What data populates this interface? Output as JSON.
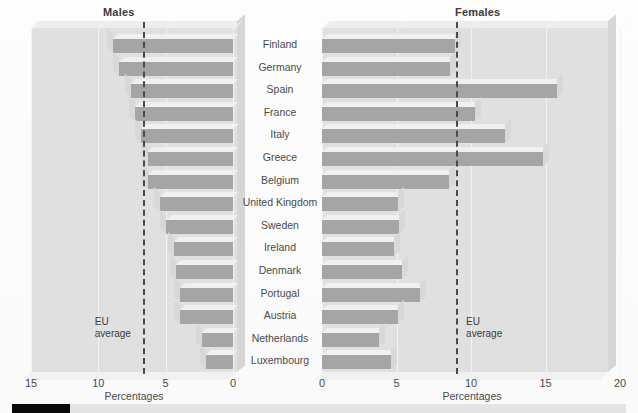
{
  "panels": {
    "left": {
      "title": "Males",
      "eu_label_line1": "EU",
      "eu_label_line2": "average",
      "axis_title": "Percentages"
    },
    "right": {
      "title": "Females",
      "eu_label_line1": "EU",
      "eu_label_line2": "average",
      "axis_title": "Percentages"
    }
  },
  "axes": {
    "left_ticks": [
      "15",
      "10",
      "5",
      "0"
    ],
    "right_ticks": [
      "0",
      "5",
      "10",
      "15",
      "20"
    ]
  },
  "countries": [
    "Finland",
    "Germany",
    "Spain",
    "France",
    "Italy",
    "Greece",
    "Belgium",
    "United Kingdom",
    "Sweden",
    "Ireland",
    "Denmark",
    "Portugal",
    "Austria",
    "Netherlands",
    "Luxembourg"
  ],
  "chart_data": {
    "type": "bar",
    "orientation": "horizontal",
    "layout": "back-to-back pyramid, two panels",
    "categories": [
      "Finland",
      "Germany",
      "Spain",
      "France",
      "Italy",
      "Greece",
      "Belgium",
      "United Kingdom",
      "Sweden",
      "Ireland",
      "Denmark",
      "Portugal",
      "Austria",
      "Netherlands",
      "Luxembourg"
    ],
    "series": [
      {
        "name": "Males",
        "panel": "left",
        "xlabel": "Percentages",
        "xlim": [
          15,
          0
        ],
        "reversed": true,
        "tick_values": [
          15,
          10,
          5,
          0
        ],
        "eu_average": 6.7,
        "values": [
          8.9,
          8.5,
          7.6,
          7.3,
          6.8,
          6.3,
          6.3,
          5.4,
          5.0,
          4.4,
          4.2,
          3.9,
          3.9,
          2.3,
          2.0
        ]
      },
      {
        "name": "Females",
        "panel": "right",
        "xlabel": "Percentages",
        "xlim": [
          0,
          20
        ],
        "reversed": false,
        "tick_values": [
          0,
          5,
          10,
          15,
          20
        ],
        "eu_average": 9.0,
        "values": [
          8.9,
          8.6,
          15.8,
          10.3,
          12.3,
          14.8,
          8.5,
          5.1,
          5.2,
          4.8,
          5.4,
          6.6,
          5.1,
          3.8,
          4.6
        ]
      }
    ],
    "grid": true,
    "legend": "none",
    "annotations": [
      "EU average (dashed vertical line on each panel)"
    ]
  },
  "colors": {
    "bar_face": "#a5a5a5",
    "bar_top": "#f0f0f0",
    "bar_end": "#d8d8d8",
    "panel_bg": "#e0e0e0",
    "eu_line": "#4a4a4a",
    "strip_fill": "#090909",
    "text": "#4a4a4a"
  },
  "bottom_strip": {
    "label": ""
  }
}
